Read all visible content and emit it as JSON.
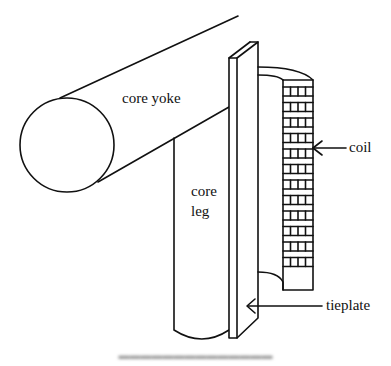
{
  "figure": {
    "type": "diagram",
    "stroke_color": "#111111",
    "background": "#ffffff"
  },
  "labels": {
    "core_yoke": "core yoke",
    "core_leg_line1": "core",
    "core_leg_line2": "leg",
    "coil": "coil",
    "tieplate": "tieplate"
  },
  "caption": {
    "text": "",
    "legible": false
  },
  "coil": {
    "rows": 12,
    "columns": 4
  }
}
